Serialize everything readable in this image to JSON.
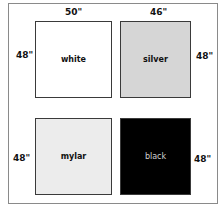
{
  "diagram": {
    "panels": [
      {
        "label": "white",
        "fill": "#ffffff",
        "text_color": "#111111"
      },
      {
        "label": "silver",
        "fill": "#d6d6d6",
        "text_color": "#111111"
      },
      {
        "label": "mylar",
        "fill": "#ececec",
        "text_color": "#111111"
      },
      {
        "label": "black",
        "fill": "#000000",
        "text_color": "#d0d0d0"
      }
    ],
    "dimensions": {
      "top_left_width": "50\"",
      "top_right_width": "46\"",
      "white_height": "48\"",
      "silver_height": "48\"",
      "mylar_height": "48\"",
      "black_height": "48\""
    }
  }
}
